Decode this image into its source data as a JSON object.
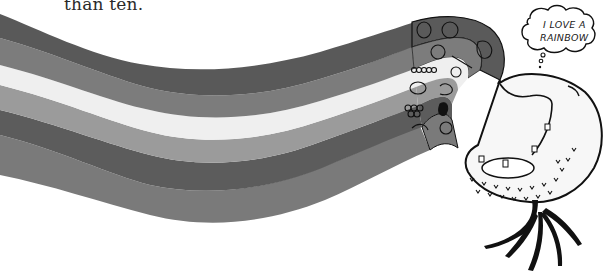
{
  "caption": {
    "text": "than ten."
  },
  "thought_bubble": {
    "line1": "I LOVE A",
    "line2": "RAINBOW"
  },
  "illustration": {
    "subject": "rainbow of fruits and vegetables flowing into the mouth of a smiling root-vegetable character",
    "bands": [
      {
        "name": "band-1-red",
        "color": "#5a5a5a"
      },
      {
        "name": "band-2-orange",
        "color": "#7c7c7c"
      },
      {
        "name": "band-3-yellow",
        "color": "#ececec"
      },
      {
        "name": "band-4-green",
        "color": "#9a9a9a"
      },
      {
        "name": "band-5-blue",
        "color": "#5e5e5e"
      },
      {
        "name": "band-6-purple",
        "color": "#7a7a7a"
      }
    ],
    "foods_icons": [
      "strawberry-icon",
      "tomato-icon",
      "apple-icon",
      "orange-icon",
      "carrot-icon",
      "pepper-icon",
      "corn-icon",
      "raspberry-icon",
      "avocado-icon",
      "broccoli-icon",
      "lettuce-icon",
      "grapes-icon",
      "eggplant-icon",
      "garlic-icon",
      "cabbage-icon"
    ]
  }
}
